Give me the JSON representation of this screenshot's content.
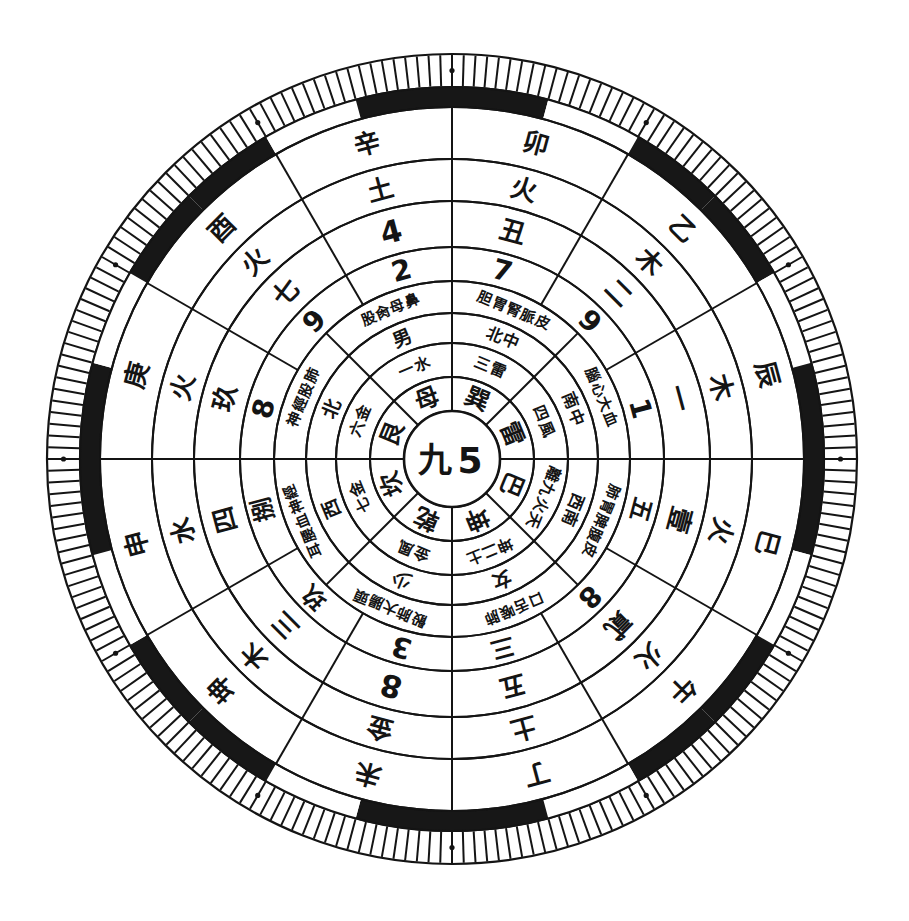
{
  "figure": {
    "kind": "luopan-divination-wheel",
    "title": "",
    "center": {
      "chinese_numeral": "九",
      "arabic_numeral": "5"
    },
    "colors": {
      "ink": "#141414",
      "paper": "#ffffff",
      "band_dark": "#171717"
    },
    "geometry": {
      "cx": 452,
      "cy": 459,
      "outer_radius": 405
    }
  },
  "rings": [
    {
      "id": "ring-tick-scale",
      "name": "outer-tick-scale",
      "r_inner": 372,
      "r_outer": 405,
      "type": "ticks",
      "tick_count": 216,
      "dot_count": 12,
      "labels": []
    },
    {
      "id": "ring-blackwhite-band",
      "name": "alternating-black-white-band",
      "r_inner": 352,
      "r_outer": 372,
      "type": "alternating-arcs",
      "segments": 24,
      "labels": []
    },
    {
      "id": "ring-earthly-branch",
      "name": "earthly-branches-and-stems-outer",
      "r_inner": 300,
      "r_outer": 352,
      "type": "sectors",
      "sector_count": 12,
      "rotate_with_angle": true,
      "labels": [
        "卯",
        "乙",
        "辰",
        "巳",
        "午",
        "丁",
        "未",
        "坤",
        "申",
        "庚",
        "酉",
        "辛"
      ]
    },
    {
      "id": "ring-five-elements-outer",
      "name": "five-elements-outer",
      "r_inner": 258,
      "r_outer": 300,
      "type": "sectors",
      "sector_count": 12,
      "rotate_with_angle": true,
      "labels": [
        "火",
        "木",
        "木",
        "火",
        "火",
        "土",
        "金",
        "木",
        "水",
        "火",
        "火",
        "土"
      ]
    },
    {
      "id": "ring-numerals-chinese",
      "name": "chinese-numerals-ring",
      "r_inner": 212,
      "r_outer": 258,
      "type": "sectors",
      "sector_count": 12,
      "rotate_with_angle": true,
      "labels": [
        "丑",
        "二",
        "一",
        "壹",
        "貳",
        "五",
        "8",
        "三",
        "四",
        "玖",
        "七",
        "4"
      ]
    },
    {
      "id": "ring-numerals-arabic",
      "name": "arabic-numerals-ring",
      "r_inner": 178,
      "r_outer": 212,
      "type": "sectors",
      "sector_count": 12,
      "rotate_with_angle": true,
      "labels": [
        "7",
        "9",
        "1",
        "五",
        "8",
        "三",
        "3",
        "玖",
        "捌",
        "8",
        "9",
        "2"
      ]
    },
    {
      "id": "ring-organs",
      "name": "organ-body-correspondence-ring",
      "r_inner": 146,
      "r_outer": 178,
      "type": "sectors",
      "sector_count": 8,
      "rotate_with_angle": true,
      "labels": [
        "胆胃腎脈皮",
        "腦心大血",
        "肺胃脾腹皮",
        "口舌喉肺",
        "骰肺大腸頭",
        "耳腰血神經",
        "神經股肺",
        "股肏母鼻"
      ]
    },
    {
      "id": "ring-direction-family",
      "name": "direction-and-family-ring",
      "r_inner": 116,
      "r_outer": 146,
      "type": "sectors",
      "sector_count": 8,
      "rotate_with_angle": true,
      "labels": [
        "北中",
        "南中",
        "西南",
        "女",
        "少",
        "西",
        "北",
        "男"
      ]
    },
    {
      "id": "ring-trigram-element",
      "name": "trigram-number-element-ring",
      "r_inner": 82,
      "r_outer": 116,
      "type": "sectors",
      "sector_count": 8,
      "rotate_with_angle": true,
      "labels": [
        "三雷",
        "四風",
        "離九火天",
        "坤二土",
        "金風",
        "七金",
        "六金",
        "一水"
      ]
    },
    {
      "id": "ring-trigrams",
      "name": "eight-trigrams-ring",
      "r_inner": 48,
      "r_outer": 82,
      "type": "sectors",
      "sector_count": 8,
      "rotate_with_angle": true,
      "labels": [
        "巽",
        "雷",
        "巴",
        "坤",
        "乾",
        "坎",
        "艮",
        "母"
      ]
    }
  ],
  "chart_data": {
    "type": "table",
    "center_label": "九 5",
    "rings_outward": [
      "eight trigrams",
      "trigram / number / element",
      "direction & family position",
      "organ & body-part correspondences",
      "arabic numerals 1-9",
      "chinese numerals",
      "five elements",
      "earthly branches & heavenly stems",
      "alternating black/white band",
      "outer tick scale"
    ],
    "trigrams": [
      "巽",
      "雷",
      "巴",
      "坤",
      "乾",
      "坎",
      "艮",
      "母"
    ],
    "five_elements": [
      "木",
      "火",
      "土",
      "金",
      "水"
    ],
    "earthly_branches": [
      "子",
      "丑",
      "寅",
      "卯",
      "辰",
      "巳",
      "午",
      "未",
      "申",
      "酉",
      "戌",
      "亥"
    ],
    "heavenly_stems": [
      "甲",
      "乙",
      "丙",
      "丁",
      "戊",
      "己",
      "庚",
      "辛",
      "壬",
      "癸"
    ],
    "arabic_numerals_present": [
      1,
      2,
      3,
      4,
      5,
      7,
      8,
      9
    ],
    "chinese_numerals_present": [
      "一",
      "二",
      "三",
      "四",
      "五",
      "七",
      "六",
      "九",
      "玖",
      "壹",
      "貳",
      "捌"
    ]
  },
  "sectors": {
    "twelve": [
      {
        "index": 0,
        "angle_deg": -75,
        "branch": "寅",
        "element": "木",
        "cn": "丑",
        "ar": "7"
      },
      {
        "index": 1,
        "angle_deg": -45,
        "branch": "卯",
        "element": "木",
        "cn": "二",
        "ar": "9"
      },
      {
        "index": 2,
        "angle_deg": -15,
        "branch": "辰",
        "element": "木",
        "cn": "一",
        "ar": "巽"
      },
      {
        "index": 3,
        "angle_deg": 15,
        "branch": "巳",
        "element": "火",
        "cn": "1",
        "ar": "五"
      },
      {
        "index": 4,
        "angle_deg": 45,
        "branch": "午",
        "element": "火",
        "cn": "貳",
        "ar": "五"
      },
      {
        "index": 5,
        "angle_deg": 75,
        "branch": "丁",
        "element": "土",
        "cn": "五",
        "ar": "8"
      },
      {
        "index": 6,
        "angle_deg": 105,
        "branch": "未",
        "element": "金",
        "cn": "8",
        "ar": "三"
      },
      {
        "index": 7,
        "angle_deg": 135,
        "branch": "坤",
        "element": "木",
        "cn": "三",
        "ar": "水"
      },
      {
        "index": 8,
        "angle_deg": 165,
        "branch": "申",
        "element": "水",
        "cn": "三",
        "ar": "3"
      },
      {
        "index": 9,
        "angle_deg": 195,
        "branch": "酉",
        "element": "火",
        "cn": "玖",
        "ar": "火"
      },
      {
        "index": 10,
        "angle_deg": 225,
        "branch": "辛",
        "element": "土",
        "cn": "七",
        "ar": "4"
      },
      {
        "index": 11,
        "angle_deg": 255,
        "branch": "戊",
        "element": "金",
        "cn": "4",
        "ar": "捌"
      }
    ]
  }
}
